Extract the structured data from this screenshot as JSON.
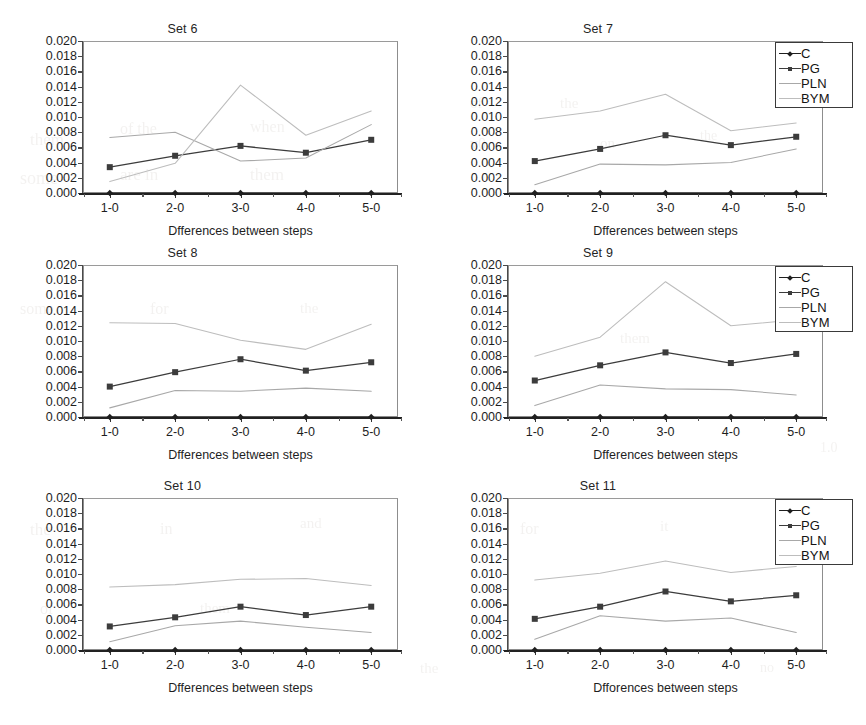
{
  "figure": {
    "panel_titles": [
      "Set 6",
      "Set 7",
      "Set 8",
      "Set 9",
      "Set 10",
      "Set 11"
    ],
    "xlabel": "Dfferences between steps",
    "xlabel_bottom_right": "Dfforences between steps",
    "x_categories": [
      "1-0",
      "2-0",
      "3-0",
      "4-0",
      "5-0"
    ],
    "y_ticklabels": [
      "0.020",
      "0.018",
      "0.016",
      "0.014",
      "0.012",
      "0.010",
      "0.008",
      "0.006",
      "0.004",
      "0.002",
      "0.000"
    ],
    "ylim": [
      0,
      0.02
    ],
    "ytick_step": 0.002,
    "legend_entries": [
      "C",
      "PG",
      "PLN",
      "BYM"
    ],
    "legend_position": "right-middle",
    "colors": {
      "C": "#1f1f1f",
      "PG": "#3c3c3c",
      "PLN": "#a8a8a8",
      "BYM": "#bdbdbd",
      "axis": "#333333",
      "frame": "#8d8d8d",
      "text": "#1e1e1e",
      "background": "#ffffff"
    }
  },
  "chart_data": [
    {
      "type": "line",
      "title": "Set 6",
      "xlabel": "Dfferences between steps",
      "ylabel": "",
      "categories": [
        "1-0",
        "2-0",
        "3-0",
        "4-0",
        "5-0"
      ],
      "ylim": [
        0,
        0.02
      ],
      "grid": false,
      "legend": [
        "C",
        "PG",
        "PLN",
        "BYM"
      ],
      "series": [
        {
          "name": "C",
          "values": [
            0.0,
            0.0,
            0.0,
            0.0,
            0.0
          ]
        },
        {
          "name": "PG",
          "values": [
            0.0034,
            0.0049,
            0.0062,
            0.0053,
            0.007
          ]
        },
        {
          "name": "PLN",
          "values": [
            0.0073,
            0.008,
            0.0042,
            0.0046,
            0.009
          ]
        },
        {
          "name": "BYM",
          "values": [
            0.0015,
            0.0039,
            0.0142,
            0.0076,
            0.0108
          ]
        }
      ]
    },
    {
      "type": "line",
      "title": "Set 7",
      "xlabel": "Dfferences between steps",
      "ylabel": "",
      "categories": [
        "1-0",
        "2-0",
        "3-0",
        "4-0",
        "5-0"
      ],
      "ylim": [
        0,
        0.02
      ],
      "grid": false,
      "legend": [
        "C",
        "PG",
        "PLN",
        "BYM"
      ],
      "series": [
        {
          "name": "C",
          "values": [
            0.0,
            0.0,
            0.0,
            0.0,
            0.0
          ]
        },
        {
          "name": "PG",
          "values": [
            0.0042,
            0.0058,
            0.0076,
            0.0063,
            0.0074
          ]
        },
        {
          "name": "PLN",
          "values": [
            0.0011,
            0.0038,
            0.0037,
            0.004,
            0.0058
          ]
        },
        {
          "name": "BYM",
          "values": [
            0.0097,
            0.0108,
            0.013,
            0.0082,
            0.0092
          ]
        }
      ]
    },
    {
      "type": "line",
      "title": "Set 8",
      "xlabel": "Dfferences between steps",
      "ylabel": "",
      "categories": [
        "1-0",
        "2-0",
        "3-0",
        "4-0",
        "5-0"
      ],
      "ylim": [
        0,
        0.02
      ],
      "grid": false,
      "legend": [
        "C",
        "PG",
        "PLN",
        "BYM"
      ],
      "series": [
        {
          "name": "C",
          "values": [
            0.0,
            0.0,
            0.0,
            0.0,
            0.0
          ]
        },
        {
          "name": "PG",
          "values": [
            0.004,
            0.0059,
            0.0076,
            0.0061,
            0.0072
          ]
        },
        {
          "name": "PLN",
          "values": [
            0.0012,
            0.0035,
            0.0034,
            0.0038,
            0.0034
          ]
        },
        {
          "name": "BYM",
          "values": [
            0.0124,
            0.0123,
            0.0101,
            0.0089,
            0.0122
          ]
        }
      ]
    },
    {
      "type": "line",
      "title": "Set 9",
      "xlabel": "Dfferences between steps",
      "ylabel": "",
      "categories": [
        "1-0",
        "2-0",
        "3-0",
        "4-0",
        "5-0"
      ],
      "ylim": [
        0,
        0.02
      ],
      "grid": false,
      "legend": [
        "C",
        "PG",
        "PLN",
        "BYM"
      ],
      "series": [
        {
          "name": "C",
          "values": [
            0.0,
            0.0,
            0.0,
            0.0,
            0.0
          ]
        },
        {
          "name": "PG",
          "values": [
            0.0048,
            0.0068,
            0.0085,
            0.0071,
            0.0083
          ]
        },
        {
          "name": "PLN",
          "values": [
            0.0015,
            0.0042,
            0.0037,
            0.0036,
            0.0029
          ]
        },
        {
          "name": "BYM",
          "values": [
            0.008,
            0.0105,
            0.0178,
            0.012,
            0.0128
          ]
        }
      ]
    },
    {
      "type": "line",
      "title": "Set 10",
      "xlabel": "Dfferences between steps",
      "ylabel": "",
      "categories": [
        "1-0",
        "2-0",
        "3-0",
        "4-0",
        "5-0"
      ],
      "ylim": [
        0,
        0.02
      ],
      "grid": false,
      "legend": [
        "C",
        "PG",
        "PLN",
        "BYM"
      ],
      "series": [
        {
          "name": "C",
          "values": [
            0.0,
            0.0,
            0.0,
            0.0,
            0.0
          ]
        },
        {
          "name": "PG",
          "values": [
            0.0031,
            0.0043,
            0.0057,
            0.0046,
            0.0057
          ]
        },
        {
          "name": "PLN",
          "values": [
            0.0011,
            0.0032,
            0.0038,
            0.003,
            0.0023
          ]
        },
        {
          "name": "BYM",
          "values": [
            0.0083,
            0.0086,
            0.0093,
            0.0094,
            0.0085
          ]
        }
      ]
    },
    {
      "type": "line",
      "title": "Set 11",
      "xlabel": "Dfforences between steps",
      "ylabel": "",
      "categories": [
        "1-0",
        "2-0",
        "3-0",
        "4-0",
        "5-0"
      ],
      "ylim": [
        0,
        0.02
      ],
      "grid": false,
      "legend": [
        "C",
        "PG",
        "PLN",
        "BYM"
      ],
      "series": [
        {
          "name": "C",
          "values": [
            0.0,
            0.0,
            0.0,
            0.0,
            0.0
          ]
        },
        {
          "name": "PG",
          "values": [
            0.0041,
            0.0057,
            0.0077,
            0.0064,
            0.0072
          ]
        },
        {
          "name": "PLN",
          "values": [
            0.0014,
            0.0045,
            0.0038,
            0.0042,
            0.0023
          ]
        },
        {
          "name": "BYM",
          "values": [
            0.0092,
            0.0101,
            0.0117,
            0.0102,
            0.011
          ]
        }
      ]
    }
  ]
}
